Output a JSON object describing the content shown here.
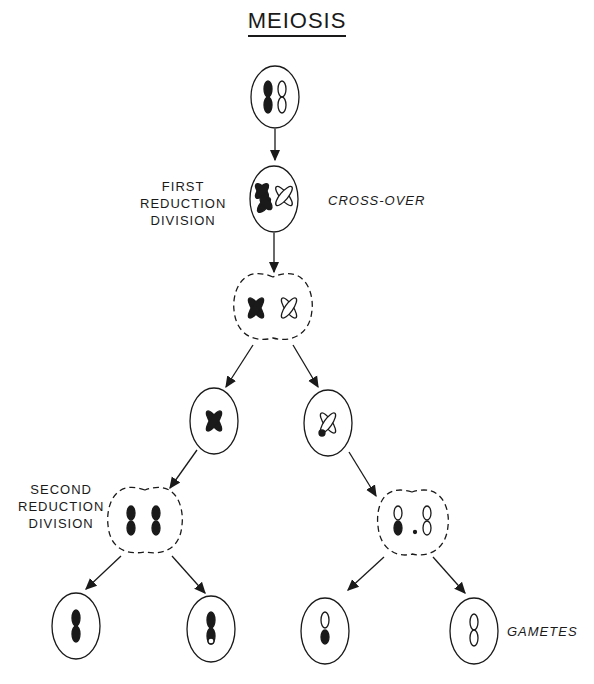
{
  "title": "MEIOSIS",
  "labels": {
    "first_division": [
      "FIRST",
      "REDUCTION",
      "DIVISION"
    ],
    "cross_over": "CROSS-OVER",
    "second_division": [
      "SECOND",
      "REDUCTION",
      "DIVISION"
    ],
    "gametes": "GAMETES"
  },
  "stages": [
    {
      "id": "parent-cell",
      "chromosomes": [
        "dark-homolog",
        "light-homolog"
      ]
    },
    {
      "id": "crossover-cell",
      "chromosomes": [
        "dark-tetrad",
        "light-tetrad"
      ]
    },
    {
      "id": "dividing-cell-1",
      "chromosomes": [
        "dark-tetrad",
        "light-tetrad"
      ]
    },
    {
      "id": "daughter-cell-left",
      "chromosomes": [
        "dark-tetrad"
      ]
    },
    {
      "id": "daughter-cell-right",
      "chromosomes": [
        "light-tetrad"
      ]
    },
    {
      "id": "dividing-cell-2-left",
      "chromosomes": [
        "dark-chromatid",
        "dark-chromatid"
      ]
    },
    {
      "id": "dividing-cell-2-right",
      "chromosomes": [
        "light-chromatid",
        "light-chromatid"
      ]
    },
    {
      "id": "gamete-1",
      "chromosomes": [
        "dark"
      ]
    },
    {
      "id": "gamete-2",
      "chromosomes": [
        "dark-with-light-tip"
      ]
    },
    {
      "id": "gamete-3",
      "chromosomes": [
        "light-with-dark-tip"
      ]
    },
    {
      "id": "gamete-4",
      "chromosomes": [
        "light"
      ]
    }
  ],
  "colors": {
    "ink": "#1a1a1a",
    "background": "#ffffff"
  }
}
